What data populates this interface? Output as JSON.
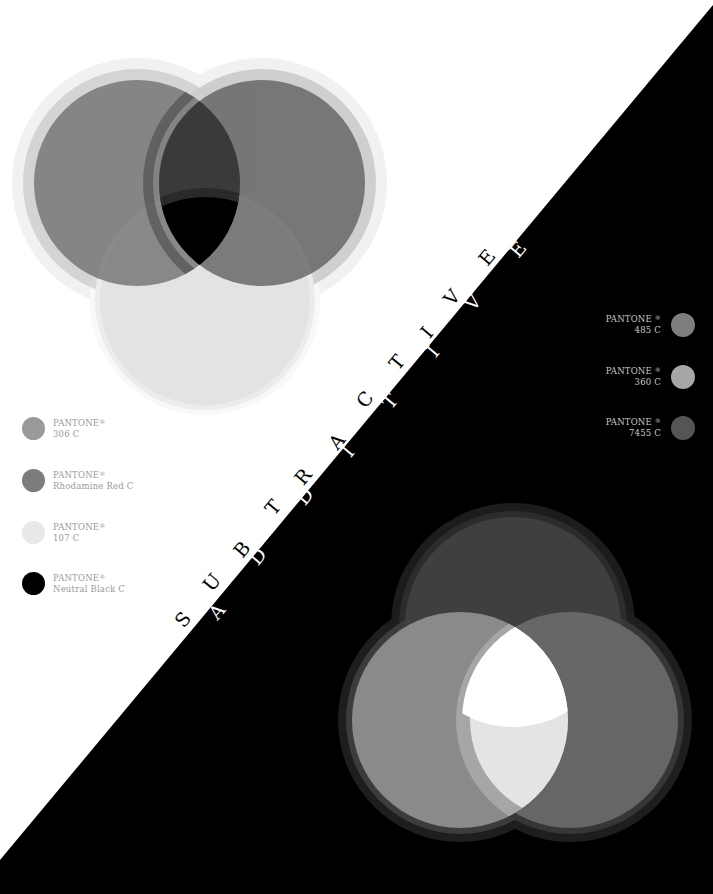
{
  "poster": {
    "background_light": "#ffffff",
    "background_dark": "#000000",
    "diagonal": {
      "from": [
        0,
        860
      ],
      "to": [
        713,
        5
      ]
    },
    "title_subtractive": "SUBTRACTIVE",
    "title_additive": "ADDITIVE"
  },
  "subtractive_venn": {
    "circles": [
      {
        "name": "left",
        "cx": 137,
        "cy": 183,
        "r": 103,
        "fill": "#6e6e6e",
        "opacity": 0.75,
        "halo1": "#b8b8b8",
        "halo2": "#dedede"
      },
      {
        "name": "right",
        "cx": 262,
        "cy": 183,
        "r": 103,
        "fill": "#5a5a5a",
        "opacity": 0.75,
        "halo1": "#aaaaaa",
        "halo2": "#d8d8d8"
      },
      {
        "name": "bottom",
        "cx": 205,
        "cy": 300,
        "r": 105,
        "fill": "#d9d9d9",
        "opacity": 0.55,
        "halo1": "#ececec",
        "halo2": "#f4f4f4"
      }
    ],
    "center_color": "#000000"
  },
  "additive_venn": {
    "circles": [
      {
        "name": "top",
        "cx": 513,
        "cy": 625,
        "r": 108,
        "fill": "#3d3d3d",
        "halo1": "#262626",
        "halo2": "#161616"
      },
      {
        "name": "left",
        "cx": 460,
        "cy": 720,
        "r": 108,
        "fill": "#8f8f8f",
        "halo1": "#5a5a5a",
        "halo2": "#2e2e2e"
      },
      {
        "name": "right",
        "cx": 570,
        "cy": 720,
        "r": 108,
        "fill": "#6a6a6a",
        "halo1": "#444444",
        "halo2": "#222222"
      }
    ],
    "center_color": "#ffffff"
  },
  "left_swatches": [
    {
      "brand": "PANTONE",
      "mark": "®",
      "code": "306 C",
      "color": "#9a9a9a"
    },
    {
      "brand": "PANTONE",
      "mark": "®",
      "code": "Rhodamine Red C",
      "color": "#7c7c7c"
    },
    {
      "brand": "PANTONE",
      "mark": "®",
      "code": "107 C",
      "color": "#e8e8e8"
    },
    {
      "brand": "PANTONE",
      "mark": "®",
      "code": "Neutral Black C",
      "color": "#000000"
    }
  ],
  "right_swatches": [
    {
      "brand": "PANTONE",
      "mark": "®",
      "code": "485 C",
      "color": "#7e7e7e"
    },
    {
      "brand": "PANTONE",
      "mark": "®",
      "code": "360 C",
      "color": "#a6a6a6"
    },
    {
      "brand": "PANTONE",
      "mark": "®",
      "code": "7455 C",
      "color": "#555555"
    }
  ],
  "diagonal_letters": {
    "rotation_deg": -50,
    "black": [
      {
        "ch": "S",
        "x": 183,
        "y": 620
      },
      {
        "ch": "U",
        "x": 212,
        "y": 583
      },
      {
        "ch": "B",
        "x": 242,
        "y": 550
      },
      {
        "ch": "T",
        "x": 273,
        "y": 508
      },
      {
        "ch": "R",
        "x": 303,
        "y": 477
      },
      {
        "ch": "A",
        "x": 337,
        "y": 442
      },
      {
        "ch": "C",
        "x": 365,
        "y": 400
      },
      {
        "ch": "T",
        "x": 397,
        "y": 363
      },
      {
        "ch": "I",
        "x": 427,
        "y": 333
      },
      {
        "ch": "V",
        "x": 452,
        "y": 298
      },
      {
        "ch": "E",
        "x": 487,
        "y": 258
      }
    ],
    "white": [
      {
        "ch": "A",
        "x": 217,
        "y": 612
      },
      {
        "ch": "D",
        "x": 258,
        "y": 557
      },
      {
        "ch": "D",
        "x": 305,
        "y": 497
      },
      {
        "ch": "I",
        "x": 348,
        "y": 452
      },
      {
        "ch": "T",
        "x": 390,
        "y": 402
      },
      {
        "ch": "I",
        "x": 433,
        "y": 352
      },
      {
        "ch": "V",
        "x": 473,
        "y": 303
      },
      {
        "ch": "E",
        "x": 518,
        "y": 250
      }
    ]
  }
}
